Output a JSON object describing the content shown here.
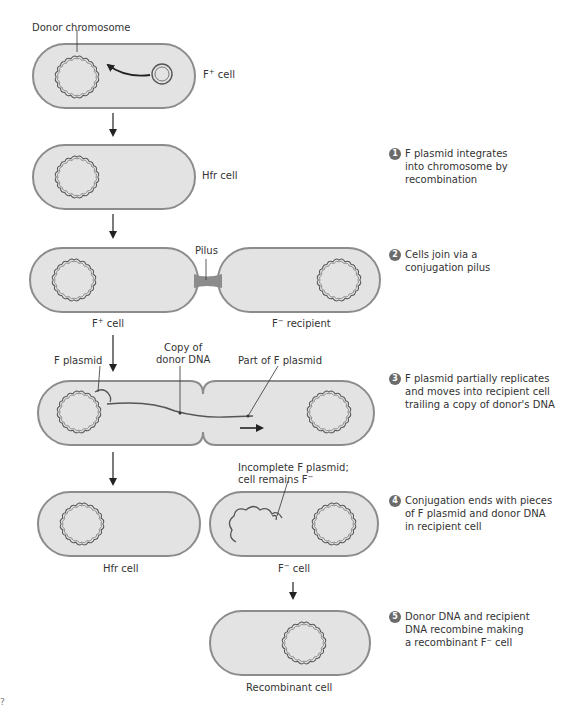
{
  "figure": {
    "colors": {
      "cell_fill": "#e3e3e3",
      "cell_outline": "#8c8c8c",
      "dna": "#555555",
      "arrow": "#222222",
      "step_badge": "#6b6b6b",
      "text": "#333333"
    },
    "labels": {
      "donor_chromosome": "Donor chromosome",
      "f_plus_cell_top": "F",
      "f_plus_cell_top_sup": "+",
      "f_plus_cell_top_tail": " cell",
      "hfr_cell_top": "Hfr cell",
      "pilus": "Pilus",
      "f_plus_cell_mid": "F",
      "f_plus_cell_mid_sup": "+",
      "f_plus_cell_mid_tail": " cell",
      "f_minus_recipient": "F",
      "f_minus_recipient_sup": "−",
      "f_minus_recipient_tail": " recipient",
      "f_plasmid": "F plasmid",
      "copy_of_donor_dna_line1": "Copy of",
      "copy_of_donor_dna_line2": "donor DNA",
      "part_of_f_plasmid": "Part of F plasmid",
      "incomplete_line1": "Incomplete F plasmid;",
      "incomplete_line2": "cell remains F",
      "incomplete_line2_sup": "−",
      "hfr_cell_bottom": "Hfr cell",
      "f_minus_cell": "F",
      "f_minus_cell_sup": "−",
      "f_minus_cell_tail": " cell",
      "recombinant_cell": "Recombinant cell",
      "corner_mark": "?"
    },
    "steps": [
      {
        "number": "1",
        "text": "F plasmid integrates into chromosome by recombination"
      },
      {
        "number": "2",
        "text": "Cells join via a conjugation pilus"
      },
      {
        "number": "3",
        "text": "F plasmid partially replicates and moves into recipient cell trailing a copy of donor's DNA"
      },
      {
        "number": "4",
        "text": "Conjugation ends with pieces of F plasmid and donor DNA in recipient cell"
      },
      {
        "number": "5",
        "text": "Donor DNA and recipient DNA recombine making a recombinant F⁻ cell"
      }
    ]
  }
}
